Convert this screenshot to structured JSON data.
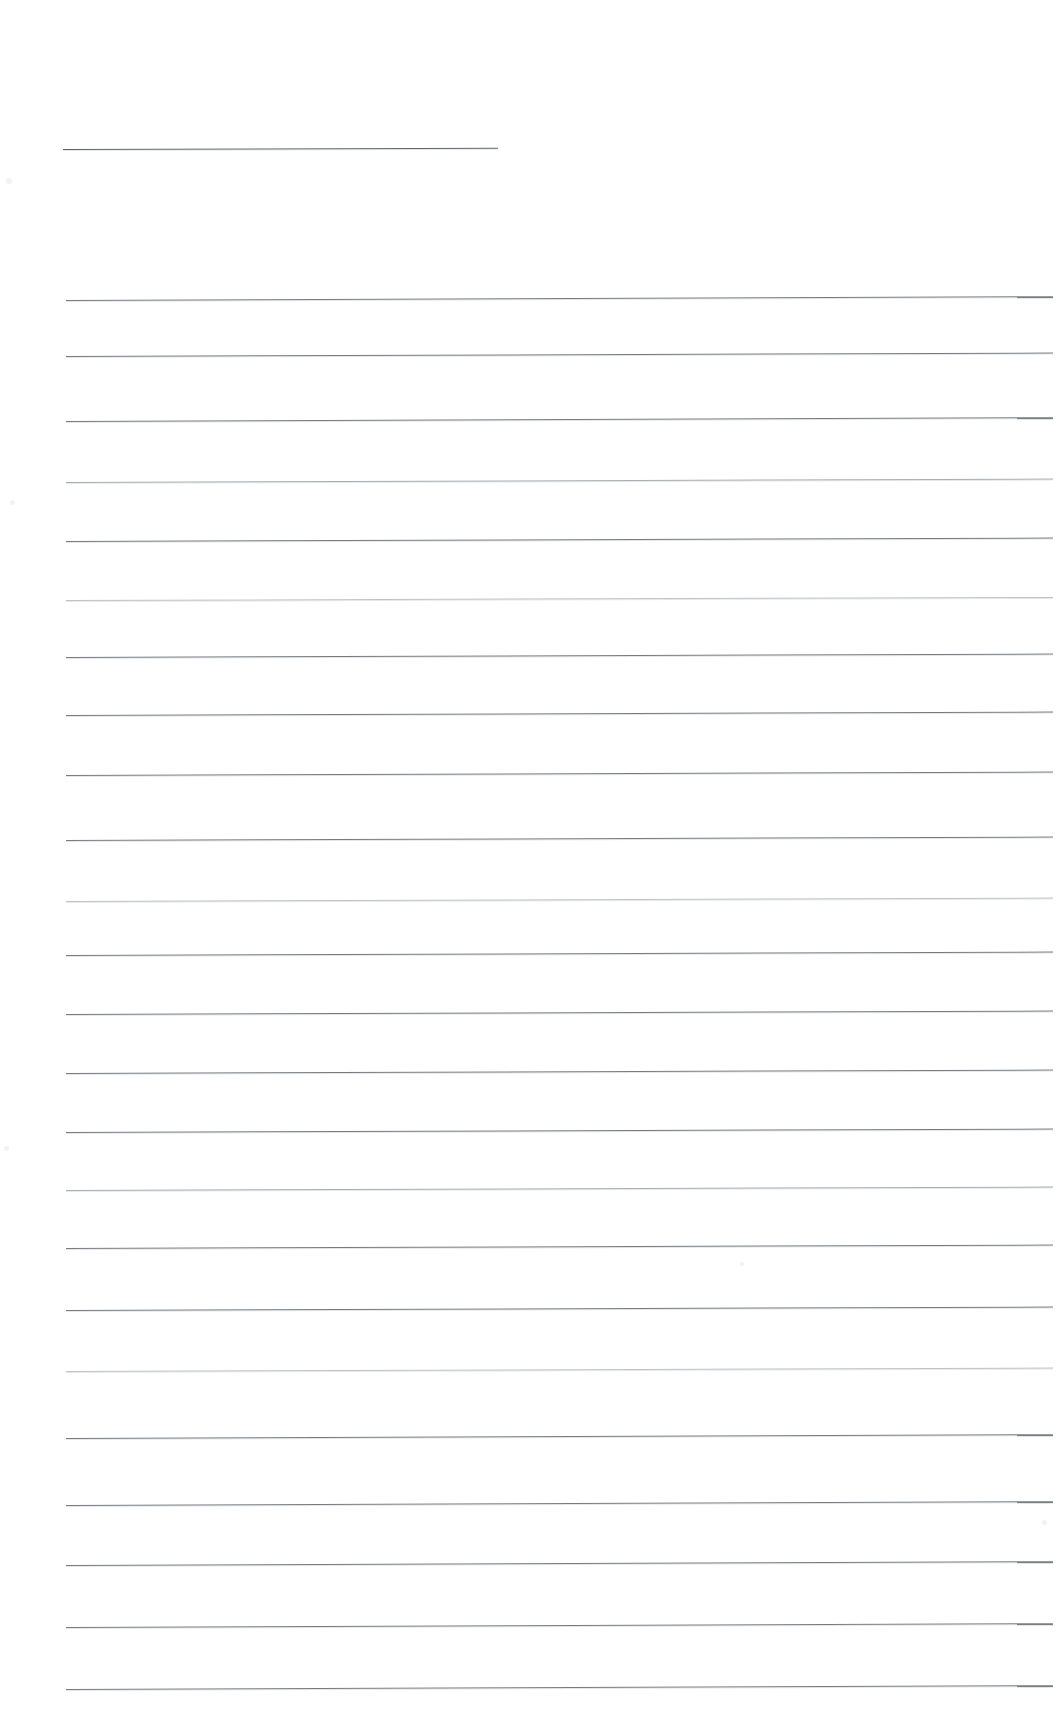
{
  "document": {
    "kind": "scanned-blank-ruled-page",
    "page_background_color": "#ffffff",
    "rule_color": "#6d7176",
    "light_rule_color": "#9aa0a6",
    "faint_rule_color": "#b0b5ba",
    "page_width": 1061,
    "page_height": 1728,
    "text_content": "",
    "visible_text": []
  },
  "header_rule": {
    "label": "header-underline",
    "x": 63,
    "y": 149,
    "width": 435,
    "tilt_deg": -0.15,
    "weight": "normal"
  },
  "ruled_lines": [
    {
      "y": 300,
      "x": 66,
      "width": 987,
      "tilt_deg": -0.22,
      "weight": "normal"
    },
    {
      "y": 356,
      "x": 66,
      "width": 987,
      "tilt_deg": -0.2,
      "weight": "normal"
    },
    {
      "y": 421,
      "x": 66,
      "width": 987,
      "tilt_deg": -0.22,
      "weight": "normal"
    },
    {
      "y": 482,
      "x": 66,
      "width": 987,
      "tilt_deg": -0.2,
      "weight": "light"
    },
    {
      "y": 541,
      "x": 66,
      "width": 987,
      "tilt_deg": -0.2,
      "weight": "normal"
    },
    {
      "y": 600,
      "x": 66,
      "width": 987,
      "tilt_deg": -0.18,
      "weight": "faint"
    },
    {
      "y": 657,
      "x": 66,
      "width": 987,
      "tilt_deg": -0.2,
      "weight": "normal"
    },
    {
      "y": 715,
      "x": 66,
      "width": 987,
      "tilt_deg": -0.2,
      "weight": "normal"
    },
    {
      "y": 775,
      "x": 66,
      "width": 987,
      "tilt_deg": -0.2,
      "weight": "normal"
    },
    {
      "y": 840,
      "x": 66,
      "width": 987,
      "tilt_deg": -0.2,
      "weight": "normal"
    },
    {
      "y": 901,
      "x": 66,
      "width": 987,
      "tilt_deg": -0.2,
      "weight": "faint"
    },
    {
      "y": 955,
      "x": 66,
      "width": 987,
      "tilt_deg": -0.2,
      "weight": "normal"
    },
    {
      "y": 1014,
      "x": 66,
      "width": 987,
      "tilt_deg": -0.2,
      "weight": "normal"
    },
    {
      "y": 1073,
      "x": 66,
      "width": 987,
      "tilt_deg": -0.2,
      "weight": "normal"
    },
    {
      "y": 1132,
      "x": 66,
      "width": 987,
      "tilt_deg": -0.2,
      "weight": "normal"
    },
    {
      "y": 1190,
      "x": 66,
      "width": 987,
      "tilt_deg": -0.2,
      "weight": "light"
    },
    {
      "y": 1248,
      "x": 66,
      "width": 987,
      "tilt_deg": -0.2,
      "weight": "normal"
    },
    {
      "y": 1310,
      "x": 66,
      "width": 987,
      "tilt_deg": -0.2,
      "weight": "normal"
    },
    {
      "y": 1371,
      "x": 66,
      "width": 987,
      "tilt_deg": -0.2,
      "weight": "faint"
    },
    {
      "y": 1438,
      "x": 66,
      "width": 987,
      "tilt_deg": -0.22,
      "weight": "normal"
    },
    {
      "y": 1505,
      "x": 66,
      "width": 987,
      "tilt_deg": -0.22,
      "weight": "normal"
    },
    {
      "y": 1565,
      "x": 66,
      "width": 987,
      "tilt_deg": -0.22,
      "weight": "normal"
    },
    {
      "y": 1627,
      "x": 66,
      "width": 987,
      "tilt_deg": -0.22,
      "weight": "normal"
    },
    {
      "y": 1689,
      "x": 66,
      "width": 987,
      "tilt_deg": -0.22,
      "weight": "normal"
    }
  ],
  "scan_artifacts": [
    {
      "x": 6,
      "y": 178,
      "size": 6
    },
    {
      "x": 10,
      "y": 500,
      "size": 5
    },
    {
      "x": 4,
      "y": 1146,
      "size": 5
    },
    {
      "x": 1042,
      "y": 1520,
      "size": 5
    },
    {
      "x": 740,
      "y": 1262,
      "size": 4
    }
  ]
}
